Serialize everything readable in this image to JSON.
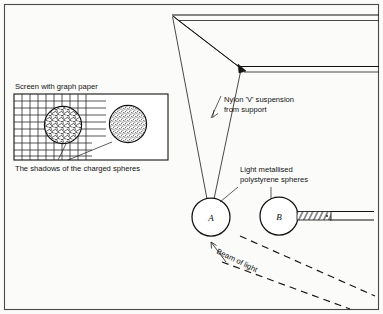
{
  "figure": {
    "kind": "physics-apparatus-diagram",
    "background_color": "#fbfbfa",
    "ink_color": "#151515",
    "border_color": "#4a4a4a",
    "width": 383,
    "height": 314
  },
  "inset": {
    "title": "Screen with graph paper",
    "caption": "The shadows of the charged spheres",
    "box": {
      "x": 14,
      "y": 94,
      "width": 154,
      "height": 66
    },
    "grid": {
      "columns": 10,
      "rows": 8,
      "extra_horizontal_lines": 5
    },
    "shadows": [
      {
        "id": "shadow-left",
        "cx": 63,
        "cy": 125,
        "r": 19,
        "texture": "scribble"
      },
      {
        "id": "shadow-right",
        "cx": 128,
        "cy": 124,
        "r": 19,
        "texture": "stipple"
      }
    ]
  },
  "labels": {
    "nylon": {
      "line1": "Nylon 'V' suspension",
      "line2": "from support",
      "x": 224,
      "y": 101
    },
    "spheres": {
      "line1": "Light metallised",
      "line2": "polystyrene spheres",
      "x": 240,
      "y": 172
    },
    "beam": {
      "text": "Beam of light",
      "x": 214,
      "y": 255,
      "rotation": 31
    }
  },
  "spheres": [
    {
      "id": "sphere-a",
      "label": "A",
      "cx": 211,
      "cy": 217,
      "r": 19
    },
    {
      "id": "sphere-b",
      "label": "B",
      "cx": 279,
      "cy": 216,
      "r": 19
    }
  ],
  "support": {
    "top_bar_y": 16,
    "lower_bar_y": 70,
    "apex": {
      "x": 172,
      "y": 16
    },
    "joint": {
      "x": 240,
      "y": 68
    },
    "hatched_beam": true
  },
  "rod": {
    "id": "insulating-rod",
    "x_start": 298,
    "x_end": 373,
    "y": 216,
    "hatched_length": 34
  },
  "beam_rays": [
    {
      "x1": 240,
      "y1": 236,
      "x2": 375,
      "y2": 296
    },
    {
      "x1": 225,
      "y1": 262,
      "x2": 348,
      "y2": 308
    }
  ],
  "arrow": {
    "id": "beam-direction-arrow",
    "from": {
      "x": 228,
      "y": 262
    },
    "to": {
      "x": 211,
      "y": 243
    }
  }
}
